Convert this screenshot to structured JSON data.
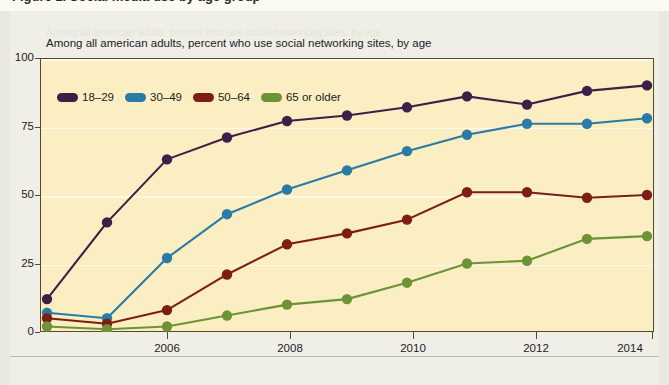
{
  "page": {
    "cut_off_headline": "Figure 1.  Social media use by age group",
    "ghost_text": "Among all american adults, percent who use social networking sites, by age"
  },
  "chart_data": {
    "type": "line",
    "title": "Among all american adults, percent who use social networking sites, by age",
    "xlabel": "",
    "ylabel": "",
    "x": [
      2005,
      2006,
      2007,
      2008,
      2009,
      2010,
      2011,
      2012,
      2013,
      2014,
      2015
    ],
    "xtick_labels": [
      "2006",
      "2008",
      "2010",
      "2012",
      "2014"
    ],
    "xtick_values": [
      2006,
      2008,
      2010,
      2012,
      2014
    ],
    "ytick_labels": [
      "0",
      "25",
      "50",
      "75",
      "100"
    ],
    "ytick_values": [
      0,
      25,
      50,
      75,
      100
    ],
    "ylim": [
      0,
      100
    ],
    "xlim": [
      2005,
      2015
    ],
    "grid": true,
    "grid_color": "#fdf9e8",
    "plot_background": "#faeec2",
    "legend_position": "top-left",
    "series": [
      {
        "name": "18–29",
        "color": "#3d1f47",
        "values": [
          12,
          40,
          63,
          71,
          77,
          79,
          82,
          86,
          83,
          88,
          90
        ]
      },
      {
        "name": "30–49",
        "color": "#2b7ba8",
        "values": [
          7,
          5,
          27,
          43,
          52,
          59,
          66,
          72,
          76,
          76,
          78
        ]
      },
      {
        "name": "50–64",
        "color": "#7d1e15",
        "values": [
          5,
          3,
          8,
          21,
          32,
          36,
          41,
          51,
          51,
          49,
          50
        ]
      },
      {
        "name": "65 or older",
        "color": "#6d9336",
        "values": [
          2,
          1,
          2,
          6,
          10,
          12,
          18,
          25,
          26,
          34,
          35
        ]
      }
    ]
  }
}
